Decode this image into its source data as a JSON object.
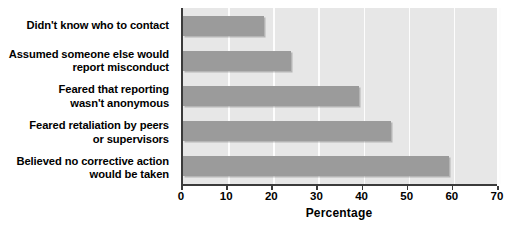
{
  "chart_data": {
    "type": "bar",
    "orientation": "horizontal",
    "title": "",
    "xlabel": "Percentage",
    "ylabel": "",
    "xlim": [
      0,
      70
    ],
    "xticks": [
      0,
      10,
      20,
      30,
      40,
      50,
      60,
      70
    ],
    "grid": true,
    "legend": false,
    "categories": [
      "Didn't know who to contact",
      "Assumed someone else would\nreport misconduct",
      "Feared that reporting\nwasn't anonymous",
      "Feared retaliation by peers\nor supervisors",
      "Believed no corrective action\nwould be taken"
    ],
    "values": [
      18,
      24,
      39,
      46,
      59
    ]
  },
  "colors": {
    "bar": "#9b9b9b",
    "plot_background": "#e7e7e7",
    "gridline": "#fdfdfd",
    "axis": "#3b3b3b",
    "text": "#000000",
    "page_background": "#ffffff"
  }
}
